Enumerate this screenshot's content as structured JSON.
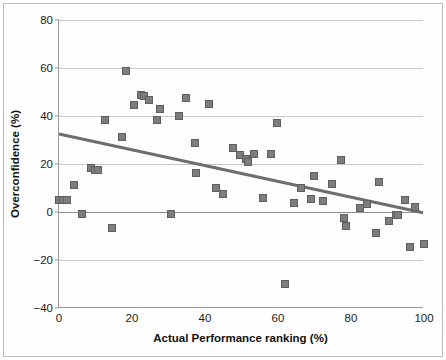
{
  "chart_data": {
    "type": "scatter",
    "title": "",
    "xlabel": "Actual Performance ranking (%)",
    "ylabel": "Overconfidence (%)",
    "xlim": [
      0,
      100
    ],
    "ylim": [
      -40,
      80
    ],
    "xticks": [
      0,
      20,
      40,
      60,
      80,
      100
    ],
    "yticks": [
      -40,
      -20,
      0,
      20,
      40,
      60,
      80
    ],
    "grid": "horizontal",
    "legend": "none",
    "marker_color": "#7d7d7d",
    "marker_edge_color": "#5f5f5f",
    "trend_color": "#6e6e6e",
    "zero_line_color": "#8f8f8f",
    "gridline_color": "#c9c9c9",
    "points": [
      {
        "x": 0.0,
        "y": 4.8
      },
      {
        "x": 1.2,
        "y": 5.0
      },
      {
        "x": 2.2,
        "y": 5.2
      },
      {
        "x": 4.0,
        "y": 11.4
      },
      {
        "x": 6.3,
        "y": -0.8
      },
      {
        "x": 8.7,
        "y": 18.3
      },
      {
        "x": 9.8,
        "y": 17.6
      },
      {
        "x": 10.6,
        "y": 17.4
      },
      {
        "x": 12.7,
        "y": 38.5
      },
      {
        "x": 14.5,
        "y": -6.8
      },
      {
        "x": 17.3,
        "y": 31.4
      },
      {
        "x": 18.4,
        "y": 58.9
      },
      {
        "x": 20.5,
        "y": 44.6
      },
      {
        "x": 22.6,
        "y": 48.8
      },
      {
        "x": 23.4,
        "y": 48.5
      },
      {
        "x": 24.6,
        "y": 46.7
      },
      {
        "x": 26.8,
        "y": 38.4
      },
      {
        "x": 27.7,
        "y": 43.0
      },
      {
        "x": 30.8,
        "y": -1.0
      },
      {
        "x": 33.0,
        "y": 40.2
      },
      {
        "x": 34.9,
        "y": 47.6
      },
      {
        "x": 37.3,
        "y": 28.7
      },
      {
        "x": 37.6,
        "y": 16.1
      },
      {
        "x": 41.0,
        "y": 45.0
      },
      {
        "x": 43.0,
        "y": 10.2
      },
      {
        "x": 45.0,
        "y": 7.3
      },
      {
        "x": 47.8,
        "y": 26.8
      },
      {
        "x": 49.5,
        "y": 23.6
      },
      {
        "x": 51.3,
        "y": 21.9
      },
      {
        "x": 51.8,
        "y": 20.7
      },
      {
        "x": 53.5,
        "y": 24.0
      },
      {
        "x": 55.8,
        "y": 5.8
      },
      {
        "x": 58.1,
        "y": 24.0
      },
      {
        "x": 59.8,
        "y": 37.1
      },
      {
        "x": 61.9,
        "y": -30.2
      },
      {
        "x": 64.3,
        "y": 3.6
      },
      {
        "x": 66.2,
        "y": 10.0
      },
      {
        "x": 69.0,
        "y": 5.3
      },
      {
        "x": 69.8,
        "y": 14.9
      },
      {
        "x": 72.3,
        "y": 4.4
      },
      {
        "x": 74.8,
        "y": 11.6
      },
      {
        "x": 77.2,
        "y": 21.7
      },
      {
        "x": 78.2,
        "y": -2.7
      },
      {
        "x": 78.5,
        "y": -5.9
      },
      {
        "x": 82.6,
        "y": 1.5
      },
      {
        "x": 84.4,
        "y": 3.5
      },
      {
        "x": 86.8,
        "y": -8.7
      },
      {
        "x": 87.8,
        "y": 12.3
      },
      {
        "x": 90.4,
        "y": -3.9
      },
      {
        "x": 92.2,
        "y": -1.3
      },
      {
        "x": 93.0,
        "y": -1.2
      },
      {
        "x": 94.8,
        "y": 4.8
      },
      {
        "x": 96.2,
        "y": -14.7
      },
      {
        "x": 97.4,
        "y": 2.1
      },
      {
        "x": 100.0,
        "y": -13.4
      }
    ],
    "trendline": {
      "x0": 0,
      "y0": 32.3,
      "x1": 100,
      "y1": -0.6
    }
  }
}
